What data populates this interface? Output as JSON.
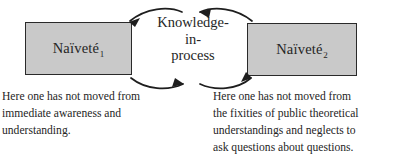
{
  "diagram": {
    "colors": {
      "box_fill": "#c9c9c9",
      "box_border": "#2a2a2a",
      "text": "#252525",
      "arrow": "#1e1e1e",
      "background": "#ffffff"
    },
    "nodes": {
      "left_box": {
        "label_base": "Naïveté",
        "label_subscript": "1"
      },
      "right_box": {
        "label_base": "Naïveté",
        "label_subscript": "2"
      },
      "center": {
        "lines": [
          "Knowledge-",
          "in-",
          "process"
        ]
      }
    },
    "arrows": [
      {
        "name": "center-to-left-top",
        "direction": "left",
        "position": "top-left"
      },
      {
        "name": "right-to-center-top",
        "direction": "left",
        "position": "top-right"
      },
      {
        "name": "left-to-center-bottom",
        "direction": "right",
        "position": "bottom-left"
      },
      {
        "name": "center-to-right-bottom",
        "direction": "right",
        "position": "bottom-right"
      }
    ],
    "captions": {
      "left": {
        "lines": [
          "Here one has not moved from",
          "immediate awareness and",
          "understanding."
        ]
      },
      "right": {
        "lines": [
          "Here one has not moved from",
          "the fixities of public theoretical",
          "understandings and neglects to",
          "ask questions about questions."
        ]
      }
    }
  }
}
